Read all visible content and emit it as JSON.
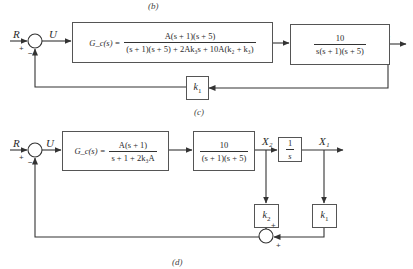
{
  "captions": {
    "top_prev": "(b)",
    "diagram_c": "(c)",
    "diagram_d": "(d)"
  },
  "diagram_c": {
    "input_label": "R",
    "control_label": "U",
    "output_label": "X₁",
    "summing_junction": {
      "plus_sign": "+",
      "minus_sign": "−"
    },
    "controller_block": {
      "name": "G_c(s) =",
      "numerator": "A(s + 1)(s + 5)",
      "denominator": "(s + 1)(s + 5) + 2Ak₃s + 10A(k₂ + k₃)"
    },
    "plant_block": {
      "numerator": "10",
      "denominator": "s(s + 1)(s + 5)"
    },
    "feedback_block": {
      "gain": "k",
      "subscript": "1"
    }
  },
  "diagram_d": {
    "input_label": "R",
    "control_label": "U",
    "intermediate_label": "X₂",
    "output_label": "X₁",
    "summing_junction": {
      "plus_sign": "+",
      "minus_sign": "−"
    },
    "controller_block": {
      "name": "G_c(s) =",
      "numerator": "A(s + 1)",
      "denominator": "s + 1 + 2k₃A"
    },
    "plant_block": {
      "numerator": "10",
      "denominator": "(s + 1)(s + 5)"
    },
    "integrator_block": {
      "numerator": "1",
      "denominator": "s"
    },
    "feedback_block_k2": {
      "gain": "k",
      "subscript": "2"
    },
    "feedback_block_k1": {
      "gain": "k",
      "subscript": "1"
    },
    "feedback_summer": {
      "plus_top": "+",
      "plus_bottom": "+"
    }
  },
  "colors": {
    "line": "#333333",
    "background": "#ffffff",
    "text": "#2a2a2a"
  }
}
